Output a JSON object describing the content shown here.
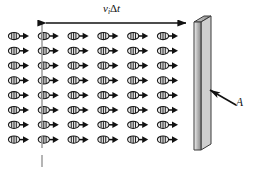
{
  "figure": {
    "background_color": "#ffffff"
  },
  "labels": {
    "velocity_time": {
      "symbol": "v",
      "subscript": "i",
      "delta": "Δ",
      "time": "t",
      "full_text": "vᵢΔt"
    },
    "area": {
      "text": "A"
    }
  },
  "dimension_arrow": {
    "name": "v-i-delta-t-dimension",
    "x_start": 42,
    "x_end": 190,
    "y": 23,
    "double_headed": true,
    "color": "#111111"
  },
  "extension_line": {
    "name": "left-boundary-extension-line",
    "x": 42,
    "y_top": 23,
    "y_bottom": 166,
    "color": "#9a9a9a",
    "dashed_segments": [
      [
        23,
        128
      ],
      [
        138,
        148
      ],
      [
        155,
        166
      ]
    ]
  },
  "wall": {
    "name": "wall-slab",
    "front_face": {
      "top_left_x": 194,
      "top_y": 22,
      "bottom_y": 150,
      "width": 7
    },
    "top_depth_offset_x": 10,
    "top_depth_offset_y": -6,
    "fill_light": "#f2f2f2",
    "fill_mid": "#bdbdbd",
    "fill_dark": "#8f8f8f",
    "stroke": "#3a3a3a"
  },
  "area_pointer": {
    "name": "area-leader-arrow",
    "tail_x": 235,
    "tail_y": 104,
    "head_x": 207,
    "head_y": 88,
    "color": "#111111"
  },
  "particle_grid": {
    "rows": 8,
    "columns": 6,
    "x_start": 14,
    "x_step": 29.8,
    "y_start": 36,
    "y_step": 14.8,
    "particle": {
      "name": "molecule-with-velocity-arrow",
      "body_shape": "ellipse",
      "body_rx": 5.6,
      "body_ry": 3.6,
      "body_fill": "#e8e8e8",
      "body_stroke": "#1a1a1a",
      "internal_stripes": 3,
      "stripe_color": "#1a1a1a",
      "arrow_color": "#111111",
      "arrow_length": 8.5
    }
  }
}
